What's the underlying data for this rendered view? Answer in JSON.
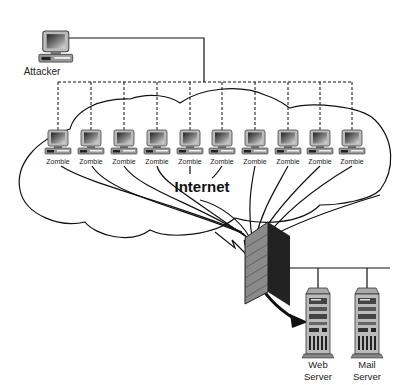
{
  "diagram": {
    "type": "DDoS attack network diagram",
    "attacker": {
      "label": "Attacker"
    },
    "cloud": {
      "label": "Internet"
    },
    "zombies": [
      {
        "label": "Zombie",
        "x": 66
      },
      {
        "label": "Zombie",
        "x": 92
      },
      {
        "label": "Zombie",
        "x": 124
      },
      {
        "label": "Zombie",
        "x": 157
      },
      {
        "label": "Zombie",
        "x": 190
      },
      {
        "label": "Zombie",
        "x": 222
      },
      {
        "label": "Zombie",
        "x": 255
      },
      {
        "label": "Zombie",
        "x": 288
      },
      {
        "label": "Zombie",
        "x": 320
      },
      {
        "label": "Zombie",
        "x": 352
      }
    ],
    "firewall": {
      "label": ""
    },
    "servers": [
      {
        "line1": "Web",
        "line2": "Server"
      },
      {
        "line1": "Mail",
        "line2": "Server"
      }
    ],
    "colors": {
      "line": "#111111",
      "background": "#ffffff",
      "brick": "#8a8a8a",
      "monitor": "#555555"
    }
  }
}
